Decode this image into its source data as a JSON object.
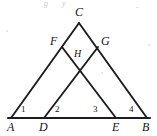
{
  "figure": {
    "width": 157,
    "height": 136,
    "background_color": "#ffffff",
    "stroke_color": "#1d1d1d",
    "label_color": "#141414"
  },
  "points": [
    {
      "id": "A",
      "label": "A",
      "x": 11,
      "y": 118,
      "label_x": 7,
      "label_y": 121
    },
    {
      "id": "D",
      "label": "D",
      "x": 44,
      "y": 118,
      "label_x": 39,
      "label_y": 121
    },
    {
      "id": "E",
      "label": "E",
      "x": 116,
      "y": 118,
      "label_x": 112,
      "label_y": 121
    },
    {
      "id": "B",
      "label": "B",
      "x": 147,
      "y": 118,
      "label_x": 143,
      "label_y": 121
    },
    {
      "id": "C",
      "label": "C",
      "x": 79,
      "y": 23,
      "label_x": 75,
      "label_y": 6
    },
    {
      "id": "F",
      "label": "F",
      "x": 62,
      "y": 47,
      "label_x": 50,
      "label_y": 36
    },
    {
      "id": "G",
      "label": "G",
      "x": 98,
      "y": 47,
      "label_x": 101,
      "label_y": 36
    },
    {
      "id": "H",
      "label": "H",
      "x": 80,
      "y": 73,
      "label_x": 74,
      "label_y": 50
    }
  ],
  "segments": [
    {
      "id": "AC",
      "from": "A",
      "to": "C",
      "kind": "side"
    },
    {
      "id": "CB",
      "from": "C",
      "to": "B",
      "kind": "side"
    },
    {
      "id": "DG",
      "from": "D",
      "to": "G",
      "kind": "cevian"
    },
    {
      "id": "EF",
      "from": "E",
      "to": "F",
      "kind": "cevian"
    },
    {
      "id": "AB",
      "from": "A",
      "to": "B",
      "kind": "base"
    }
  ],
  "angles": [
    {
      "id": "angle-1",
      "label": "1",
      "vertex": "A",
      "x": 21,
      "y": 105
    },
    {
      "id": "angle-2",
      "label": "2",
      "vertex": "D",
      "x": 55,
      "y": 105
    },
    {
      "id": "angle-3",
      "label": "3",
      "vertex": "E",
      "x": 93,
      "y": 105
    },
    {
      "id": "angle-4",
      "label": "4",
      "vertex": "B",
      "x": 129,
      "y": 105
    }
  ],
  "artifacts": {
    "marks": [
      {
        "id": "smudge-top-left",
        "text": "g",
        "x": 44,
        "y": 1
      },
      {
        "id": "smudge-top-mid",
        "text": "y",
        "x": 62,
        "y": 0
      },
      {
        "id": "smudge-top-right",
        "text": "-",
        "x": 136,
        "y": 5
      }
    ]
  }
}
